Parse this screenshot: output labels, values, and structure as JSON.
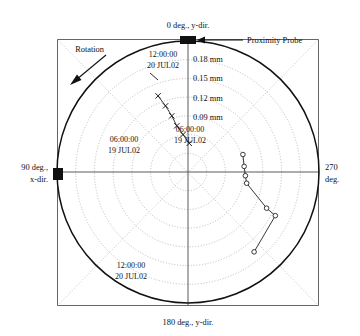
{
  "figure": {
    "type": "polar-orbit-plot",
    "title": "",
    "background": "#ffffff",
    "frame_color": "#555555",
    "axis_color": "#555555",
    "grid_color": "#aaaaaa",
    "shaft_circle_color": "#111111",
    "trace_color": "#222222"
  },
  "axis_labels": {
    "top": "0 deg., y-dir.",
    "bottom": "180 deg., y-dir.",
    "left_line1": "90 deg.,",
    "left_line2": "x-dir.",
    "right_line1": "270",
    "right_line2": "deg."
  },
  "annotations": {
    "probe_label": "Proximity Probe",
    "rotation_label": "Rotation"
  },
  "ring_labels": [
    "0.18 mm",
    "0.15 mm",
    "0.12 mm",
    "0.09 mm"
  ],
  "trace_labels": {
    "upper_start_time": "12:00:00",
    "upper_start_date": "20 JUL02",
    "upper_end_time": "06:00:00",
    "upper_end_date": "19 JUL02",
    "lower_start_time": "06:00:00",
    "lower_start_date": "19 JUL02",
    "lower_end_time": "12:00:00",
    "lower_end_date": "20 JUL02"
  },
  "chart_data": {
    "type": "scatter",
    "subtype": "polar",
    "title": "",
    "xlabel": "",
    "ylabel": "",
    "angular_unit": "degrees",
    "radial_unit": "mm",
    "angular_ticks": [
      0,
      90,
      180,
      270
    ],
    "angular_tick_labels": [
      "0 deg., y-dir.",
      "90 deg., x-dir.",
      "180 deg., y-dir.",
      "270 deg."
    ],
    "angular_direction": "clockwise-from-top-is-0-then-90-at-left",
    "radial_ticks": [
      0.09,
      0.12,
      0.15,
      0.18
    ],
    "radial_tick_labels": [
      "0.09 mm",
      "0.12 mm",
      "0.15 mm",
      "0.18 mm"
    ],
    "radial_grid_rings_mm": [
      0.03,
      0.06,
      0.09,
      0.12,
      0.15,
      0.18
    ],
    "rlim": [
      0,
      0.21
    ],
    "grid": true,
    "legend": false,
    "clearance_circle_mm": 0.21,
    "series": [
      {
        "name": "Upper trace (19-20 JUL02)",
        "marker": "x",
        "label_start": "12:00:00 20 JUL02",
        "label_end": "06:00:00 19 JUL02",
        "points_xy_mm": [
          {
            "x": -0.048,
            "y": 0.122
          },
          {
            "x": -0.036,
            "y": 0.106
          },
          {
            "x": -0.026,
            "y": 0.09
          },
          {
            "x": -0.018,
            "y": 0.074
          },
          {
            "x": -0.008,
            "y": 0.06
          },
          {
            "x": 0.002,
            "y": 0.046
          }
        ]
      },
      {
        "name": "Lower trace (19-20 JUL02)",
        "marker": "o",
        "label_start": "06:00:00 19 JUL02",
        "label_end": "12:00:00 20 JUL02",
        "points_xy_mm": [
          {
            "x": 0.088,
            "y": 0.028
          },
          {
            "x": 0.09,
            "y": 0.009
          },
          {
            "x": 0.092,
            "y": -0.006
          },
          {
            "x": 0.094,
            "y": -0.018
          },
          {
            "x": 0.126,
            "y": -0.058
          },
          {
            "x": 0.14,
            "y": -0.07
          },
          {
            "x": 0.106,
            "y": -0.128
          }
        ]
      }
    ]
  }
}
